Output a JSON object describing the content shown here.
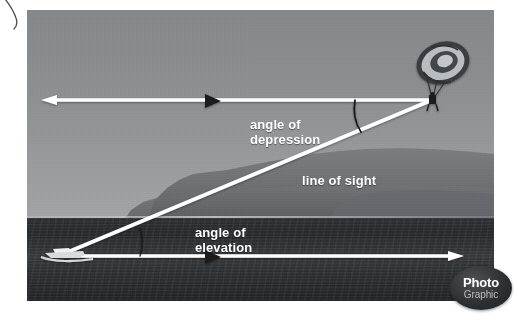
{
  "domain": "Natural-Image",
  "scene": {
    "description": "Grayscale photograph of a parasailer towed by a speedboat, annotated with a trigonometry diagram",
    "subjects": [
      "parasail-canopy",
      "parasailer",
      "speedboat",
      "headland-hills",
      "sea",
      "sky"
    ]
  },
  "photo": {
    "x": 27,
    "y": 10,
    "width": 467,
    "height": 291,
    "palette": {
      "sky_top": "#85888b",
      "sky_bottom": "#a2a4a8",
      "hills": "#6e7275",
      "sea": "#2e3134",
      "overlay_line": "#ffffff",
      "marker": "#1b1b1b",
      "label_text": "#ffffff",
      "page_background": "#ffffff"
    },
    "horizon_y": 208
  },
  "labels": [
    {
      "id": "angle-of-depression",
      "text": "angle of\ndepression",
      "x": 223,
      "y": 107
    },
    {
      "id": "line-of-sight",
      "text": "line of sight",
      "x": 275,
      "y": 163
    },
    {
      "id": "angle-of-elevation",
      "text": "angle of\nelevation",
      "x": 168,
      "y": 215
    }
  ],
  "geometry": {
    "vertex_top": {
      "x": 432,
      "y": 100,
      "label": "parasailer"
    },
    "vertex_bottom": {
      "x": 68,
      "y": 252,
      "label": "boat"
    },
    "top_horizontal": {
      "from_x": 45,
      "from_y": 100,
      "to_x": 432,
      "to_y": 100,
      "arrowhead": "left"
    },
    "bottom_horizontal": {
      "from_x": 68,
      "from_y": 256,
      "to_x": 462,
      "to_y": 256,
      "arrowhead": "right"
    },
    "line_of_sight": {
      "from_x": 68,
      "from_y": 252,
      "to_x": 432,
      "to_y": 100,
      "arrowheads": "both"
    },
    "direction_marker_top": {
      "x": 212,
      "y": 101,
      "points": "right"
    },
    "direction_marker_bottom": {
      "x": 212,
      "y": 256,
      "points": "right"
    },
    "arc_depression": {
      "cx": 432,
      "cy": 100,
      "radius": 76
    },
    "arc_elevation": {
      "cx": 68,
      "cy": 252,
      "radius": 72
    }
  },
  "watermark": {
    "line1": "Photo",
    "line2": "Graphic",
    "x": 450,
    "y": 266,
    "width": 62,
    "height": 44,
    "shape": "ellipse"
  }
}
